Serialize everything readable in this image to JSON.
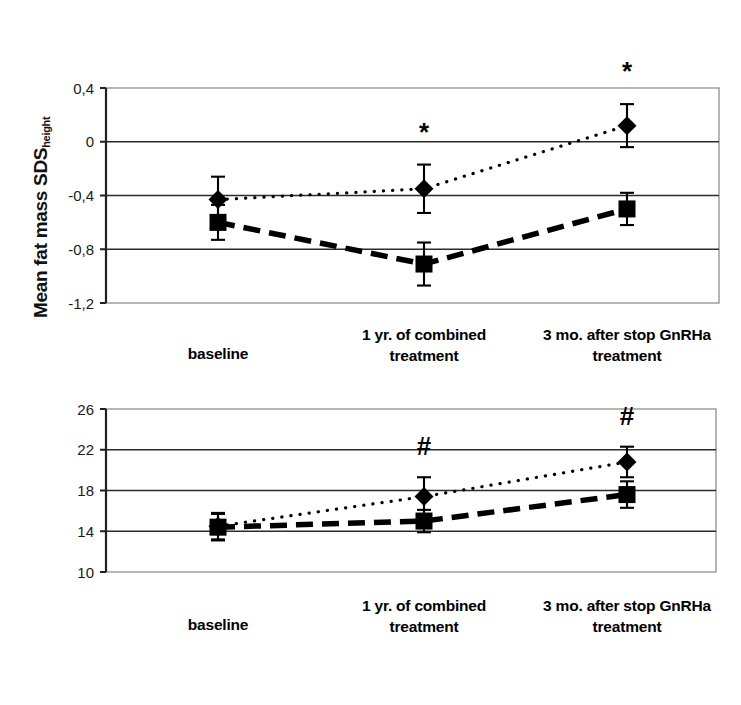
{
  "figure": {
    "background": "#ffffff",
    "ink_color": "#000000"
  },
  "chart_data": [
    {
      "id": "fat-mass-sds",
      "type": "line",
      "title": "",
      "xlabel": "",
      "ylabel": "Mean fat mass SDS",
      "ylabel_subscript": "height",
      "categories": [
        "baseline",
        "1 yr. of combined treatment",
        "3 mo. after stop GnRHa treatment"
      ],
      "ytick_labels": [
        "0,4",
        "0",
        "-0,4",
        "-0,8",
        "-1,2"
      ],
      "ytick_values": [
        0.4,
        0,
        -0.4,
        -0.8,
        -1.2
      ],
      "ylim": [
        -1.2,
        0.4
      ],
      "grid": true,
      "gridlines_at": [
        0,
        -0.4,
        -0.8
      ],
      "legend": "none",
      "series": [
        {
          "name": "dotted-diamond",
          "marker": "diamond",
          "line_style": "dotted",
          "values": [
            -0.43,
            -0.35,
            0.12
          ],
          "errors": [
            0.17,
            0.18,
            0.16
          ]
        },
        {
          "name": "dashed-square",
          "marker": "square",
          "line_style": "dashed",
          "values": [
            -0.6,
            -0.91,
            -0.5
          ],
          "errors": [
            0.13,
            0.16,
            0.12
          ]
        }
      ],
      "annotations": [
        {
          "symbol": "*",
          "category_index": 1
        },
        {
          "symbol": "*",
          "category_index": 2
        }
      ]
    },
    {
      "id": "trunk-fat-percent",
      "type": "line",
      "title": "",
      "xlabel": "",
      "ylabel": "Mean % trunk fat",
      "ylabel_subscript": "",
      "categories": [
        "baseline",
        "1 yr. of combined treatment",
        "3 mo. after stop GnRHa treatment"
      ],
      "ytick_labels": [
        "26",
        "22",
        "18",
        "14",
        "10"
      ],
      "ytick_values": [
        26,
        22,
        18,
        14,
        10
      ],
      "ylim": [
        10,
        26
      ],
      "grid": true,
      "gridlines_at": [
        22,
        18,
        14
      ],
      "legend": "none",
      "series": [
        {
          "name": "dotted-diamond",
          "marker": "diamond",
          "line_style": "dotted",
          "values": [
            14.5,
            17.4,
            20.8
          ],
          "errors": [
            1.3,
            1.9,
            1.5
          ]
        },
        {
          "name": "dashed-square",
          "marker": "square",
          "line_style": "dashed",
          "values": [
            14.4,
            15.0,
            17.6
          ],
          "errors": [
            1.3,
            1.1,
            1.3
          ]
        }
      ],
      "annotations": [
        {
          "symbol": "#",
          "category_index": 1
        },
        {
          "symbol": "#",
          "category_index": 2
        }
      ]
    }
  ]
}
